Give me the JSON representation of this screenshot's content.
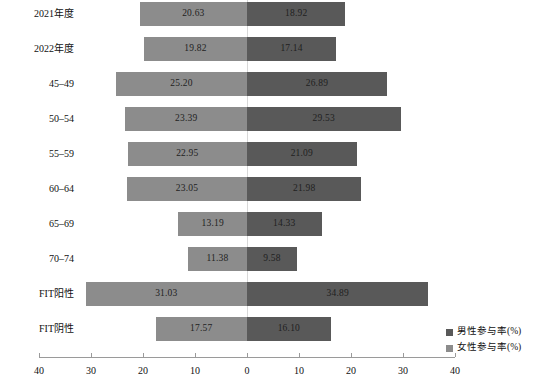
{
  "chart_data": {
    "type": "bar",
    "subtype": "diverging-population-pyramid",
    "title": "",
    "subtitle": "",
    "xlabel": "",
    "ylabel": "",
    "orientation": "horizontal",
    "grid": false,
    "legend_position": "bottom-right",
    "categories": [
      "2021年度",
      "2022年度",
      "45–49",
      "50–54",
      "55–59",
      "60–64",
      "65–69",
      "70–74",
      "FIT阳性",
      "FIT阴性"
    ],
    "series": [
      {
        "name": "女性参与率(%)",
        "side": "left",
        "color": "#8c8c8c",
        "values": [
          20.63,
          19.82,
          25.2,
          23.39,
          22.95,
          23.05,
          13.19,
          11.38,
          31.03,
          17.57
        ],
        "labels": [
          "20.63",
          "19.82",
          "25.20",
          "23.39",
          "22.95",
          "23.05",
          "13.19",
          "11.38",
          "31.03",
          "17.57"
        ]
      },
      {
        "name": "男性参与率(%)",
        "side": "right",
        "color": "#595959",
        "values": [
          18.92,
          17.14,
          26.89,
          29.53,
          21.09,
          21.98,
          14.33,
          9.58,
          34.89,
          16.1
        ],
        "labels": [
          "18.92",
          "17.14",
          "26.89",
          "29.53",
          "21.09",
          "21.98",
          "14.33",
          "9.58",
          "34.89",
          "16.10"
        ]
      }
    ],
    "axis": {
      "left_ticks": [
        40,
        30,
        20,
        10,
        0
      ],
      "right_ticks": [
        0,
        10,
        20,
        30,
        40
      ],
      "tick_labels_left": [
        "40",
        "30",
        "20",
        "10",
        "0"
      ],
      "tick_labels_right": [
        "0",
        "10",
        "20",
        "30",
        "40"
      ],
      "xlim_left": [
        0,
        40
      ],
      "xlim_right": [
        0,
        40
      ],
      "axis_color": "#9a9a9a"
    }
  },
  "legend": {
    "items": [
      {
        "label": "男性参与率(%)",
        "swatch": "male",
        "color": "#595959"
      },
      {
        "label": "女性参与率(%)",
        "swatch": "female",
        "color": "#8c8c8c"
      }
    ]
  },
  "colors": {
    "male": "#595959",
    "female": "#8c8c8c",
    "axis": "#9a9a9a",
    "zero_line": "#d8d8d8",
    "background": "#ffffff",
    "text": "#111111"
  }
}
